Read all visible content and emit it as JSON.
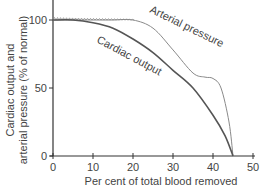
{
  "chart_data": {
    "type": "line",
    "title": "",
    "xlabel": "Per cent of total blood removed",
    "ylabel_lines": [
      "Cardiac output and",
      "arterial pressure (% of normal)"
    ],
    "xlim": [
      0,
      50
    ],
    "ylim": [
      0,
      115
    ],
    "xticks": [
      0,
      10,
      20,
      30,
      40,
      50
    ],
    "yticks": [
      0,
      50,
      100
    ],
    "grid": false,
    "legend": "none (inline curve labels)",
    "series": [
      {
        "name": "Arterial pressure",
        "color": "#8a8a8a",
        "style": "thin, oscillating near 100",
        "x": [
          0,
          5,
          10,
          15,
          20,
          25,
          30,
          35,
          38,
          40,
          42,
          44,
          45
        ],
        "y": [
          100,
          100,
          100,
          100,
          100,
          94,
          78,
          61,
          58,
          57,
          50,
          25,
          0
        ]
      },
      {
        "name": "Cardiac output",
        "color": "#555555",
        "style": "solid",
        "x": [
          0,
          5,
          10,
          15,
          20,
          25,
          30,
          35,
          40,
          43,
          45
        ],
        "y": [
          100,
          100,
          98,
          94,
          86,
          76,
          63,
          50,
          30,
          15,
          0
        ]
      }
    ],
    "annotations": [
      {
        "text": "Arterial pressure",
        "near_series": "Arterial pressure"
      },
      {
        "text": "Cardiac output",
        "near_series": "Cardiac output"
      }
    ]
  }
}
